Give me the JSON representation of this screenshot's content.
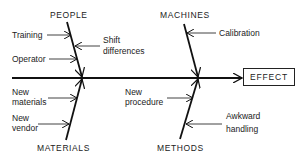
{
  "diagram": {
    "type": "fishbone",
    "effect": "EFFECT",
    "categories": {
      "people": {
        "label": "PEOPLE",
        "causes": [
          "Training",
          "Shift differences",
          "Operator"
        ]
      },
      "machines": {
        "label": "MACHINES",
        "causes": [
          "Calibration"
        ]
      },
      "materials": {
        "label": "MATERIALS",
        "causes": [
          "New materials",
          "New vendor"
        ]
      },
      "methods": {
        "label": "METHODS",
        "causes": [
          "New procedure",
          "Awkward handling"
        ]
      }
    },
    "cause_text": {
      "training": "Training",
      "shift_1": "Shift",
      "shift_2": "differences",
      "operator": "Operator",
      "calibration": "Calibration",
      "new_materials_1": "New",
      "new_materials_2": "materials",
      "new_vendor_1": "New",
      "new_vendor_2": "vendor",
      "new_procedure_1": "New",
      "new_procedure_2": "procedure",
      "awkward_1": "Awkward",
      "awkward_2": "handling"
    },
    "colors": {
      "line": "#111111",
      "text": "#222222",
      "background": "#ffffff"
    }
  }
}
